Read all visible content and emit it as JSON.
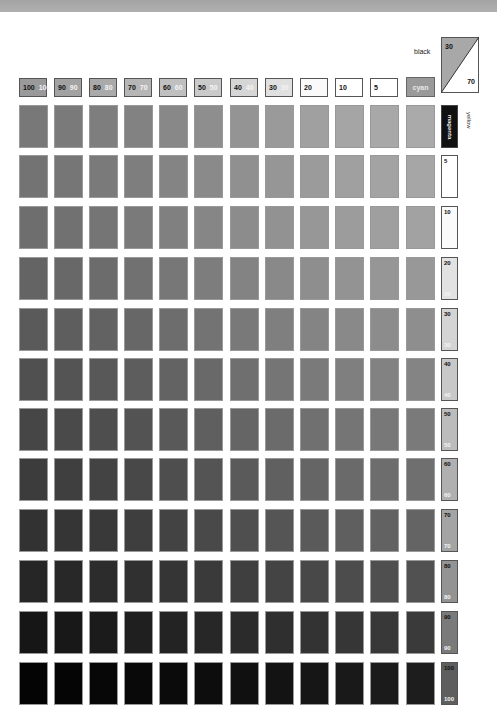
{
  "chart_data": {
    "type": "heatmap",
    "title": "",
    "xlabel": "cyan / magenta (%)",
    "ylabel": "yellow (%)",
    "corner_label": "black",
    "corner_values": {
      "black": 30,
      "other": 70
    },
    "column_labels": [
      {
        "a": "100",
        "b": "100"
      },
      {
        "a": "90",
        "b": "90"
      },
      {
        "a": "80",
        "b": "80"
      },
      {
        "a": "70",
        "b": "70"
      },
      {
        "a": "60",
        "b": "60"
      },
      {
        "a": "50",
        "b": "50"
      },
      {
        "a": "40",
        "b": "40"
      },
      {
        "a": "30",
        "b": "30"
      },
      {
        "a": "20",
        "b": ""
      },
      {
        "a": "10",
        "b": ""
      },
      {
        "a": "5",
        "b": ""
      }
    ],
    "last_column_label": "cyan",
    "row_axis_label": "yellow",
    "row_labels": [
      {
        "top": "magenta",
        "bottom": ""
      },
      {
        "top": "5",
        "bottom": ""
      },
      {
        "top": "10",
        "bottom": ""
      },
      {
        "top": "20",
        "bottom": "20"
      },
      {
        "top": "30",
        "bottom": "30"
      },
      {
        "top": "40",
        "bottom": "40"
      },
      {
        "top": "50",
        "bottom": "50"
      },
      {
        "top": "60",
        "bottom": "60"
      },
      {
        "top": "70",
        "bottom": "70"
      },
      {
        "top": "80",
        "bottom": "80"
      },
      {
        "top": "90",
        "bottom": "90"
      },
      {
        "top": "100",
        "bottom": "100"
      }
    ],
    "grid": {
      "rows": 12,
      "cols": 12
    },
    "row_tops": [
      105,
      155,
      206,
      257,
      308,
      358,
      408,
      458,
      509,
      560,
      611,
      662
    ],
    "col_lefts": [
      19,
      54,
      89,
      124,
      159,
      194,
      230,
      265,
      300,
      335,
      370,
      406
    ],
    "gray_values": [
      [
        120,
        122,
        126,
        130,
        136,
        142,
        148,
        154,
        160,
        165,
        168,
        170
      ],
      [
        115,
        118,
        122,
        126,
        132,
        138,
        144,
        150,
        155,
        160,
        163,
        166
      ],
      [
        110,
        113,
        117,
        122,
        128,
        134,
        140,
        146,
        151,
        156,
        159,
        162
      ],
      [
        100,
        104,
        108,
        113,
        119,
        125,
        131,
        137,
        142,
        147,
        150,
        152
      ],
      [
        90,
        94,
        98,
        103,
        109,
        115,
        121,
        127,
        132,
        137,
        140,
        142
      ],
      [
        80,
        84,
        88,
        93,
        99,
        105,
        111,
        117,
        122,
        127,
        130,
        132
      ],
      [
        70,
        74,
        78,
        83,
        89,
        95,
        101,
        107,
        112,
        117,
        120,
        122
      ],
      [
        60,
        63,
        67,
        72,
        78,
        84,
        90,
        96,
        101,
        106,
        109,
        111
      ],
      [
        50,
        53,
        57,
        62,
        67,
        73,
        79,
        85,
        90,
        95,
        98,
        100
      ],
      [
        38,
        40,
        44,
        48,
        53,
        58,
        63,
        68,
        72,
        76,
        79,
        81
      ],
      [
        22,
        24,
        27,
        31,
        35,
        39,
        43,
        47,
        51,
        54,
        56,
        58
      ],
      [
        4,
        5,
        7,
        9,
        11,
        13,
        16,
        19,
        22,
        25,
        27,
        29
      ]
    ],
    "header_fill": [
      "#9a9a9a",
      "#a2a2a2",
      "#aaaaaa",
      "#b6b6b6",
      "#c0c0c0",
      "#cacaca",
      "#d6d6d6",
      "#e0e0e0",
      "#fafafa",
      "#ffffff",
      "#ffffff"
    ],
    "row_label_fill": [
      "#111111",
      "#ffffff",
      "#fafafa",
      "#e2e2e2",
      "#d4d4d4",
      "#c8c8c8",
      "#bcbcbc",
      "#b0b0b0",
      "#a4a4a4",
      "#939393",
      "#7a7a7a",
      "#5e5e5e"
    ]
  }
}
